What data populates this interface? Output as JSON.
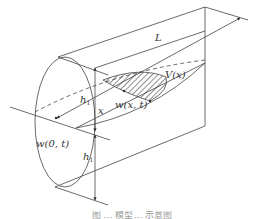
{
  "figure": {
    "labels": {
      "L": "L",
      "V": "V(x)",
      "w_xt": "w(x, t)",
      "w_0t": "w(0, t)",
      "x": "x",
      "h1_upper": "h",
      "h1_upper_sub": "1",
      "h1_lower": "h",
      "h1_lower_sub": "1"
    },
    "caption": "图 … 模型… 示意图",
    "colors": {
      "line": "#444444",
      "hatch": "#333333",
      "background": "#ffffff"
    }
  }
}
